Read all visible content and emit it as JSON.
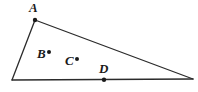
{
  "figure": {
    "kind": "geometry-diagram",
    "canvas": {
      "width": 198,
      "height": 92,
      "background": "#ffffff"
    },
    "stroke": {
      "color": "#2b2b2b",
      "width": 1.3
    },
    "dot": {
      "color": "#1a1a1a",
      "radius": 2.0
    },
    "triangle": {
      "name": "triangle",
      "vertices": [
        {
          "name": "A",
          "x": 35,
          "y": 20,
          "labeled": true,
          "dot": true
        },
        {
          "name": "bottom-left",
          "x": 12,
          "y": 80,
          "labeled": false,
          "dot": false
        },
        {
          "name": "bottom-right",
          "x": 193,
          "y": 79,
          "labeled": false,
          "dot": false
        }
      ],
      "edges": [
        {
          "name": "edge-A-bottom-left",
          "from": [
            35,
            20
          ],
          "to": [
            12,
            80
          ]
        },
        {
          "name": "edge-A-bottom-right",
          "from": [
            35,
            20
          ],
          "to": [
            193,
            79
          ]
        },
        {
          "name": "edge-base",
          "from": [
            12,
            80
          ],
          "to": [
            193,
            79
          ]
        }
      ]
    },
    "points": [
      {
        "name": "A",
        "label": "A",
        "dot_x": 35,
        "dot_y": 20,
        "label_x": 29,
        "label_y": 1,
        "location": "vertex"
      },
      {
        "name": "B",
        "label": "B",
        "dot_x": 49,
        "dot_y": 52,
        "label_x": 37,
        "label_y": 47,
        "location": "interior"
      },
      {
        "name": "C",
        "label": "C",
        "dot_x": 77,
        "dot_y": 59,
        "label_x": 65,
        "label_y": 54,
        "location": "interior"
      },
      {
        "name": "D",
        "label": "D",
        "dot_x": 104,
        "dot_y": 80,
        "label_x": 99,
        "label_y": 62,
        "location": "on-base-edge"
      }
    ],
    "labels": {
      "A": "A",
      "B": "B",
      "C": "C",
      "D": "D"
    }
  }
}
